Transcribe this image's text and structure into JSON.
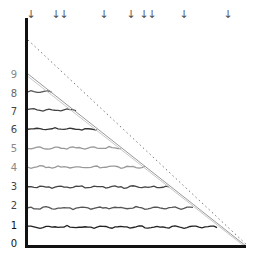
{
  "diagram": {
    "type": "staircase-levels",
    "y_labels": [
      {
        "text": "0",
        "y": 244,
        "color": "#111111"
      },
      {
        "text": "1",
        "y": 226,
        "color": "#111111"
      },
      {
        "text": "2",
        "y": 206,
        "color": "#444444"
      },
      {
        "text": "3",
        "y": 187,
        "color": "#444444"
      },
      {
        "text": "4",
        "y": 168,
        "color": "#888888"
      },
      {
        "text": "5",
        "y": 149,
        "color": "#888888"
      },
      {
        "text": "6",
        "y": 130,
        "color": "#444444"
      },
      {
        "text": "7",
        "y": 112,
        "color": "#444444"
      },
      {
        "text": "8",
        "y": 94,
        "color": "#666666"
      },
      {
        "text": "9",
        "y": 75,
        "color": "#888888"
      }
    ],
    "arrows": [
      {
        "glyph": "↓",
        "x": 31
      },
      {
        "glyph": "↓",
        "x": 56
      },
      {
        "glyph": "↓",
        "x": 64
      },
      {
        "glyph": "↓",
        "x": 104
      },
      {
        "glyph": "↓",
        "x": 131
      },
      {
        "glyph": "↓",
        "x": 144
      },
      {
        "glyph": "↓",
        "x": 152
      },
      {
        "glyph": "↓",
        "x": 184
      },
      {
        "glyph": "↓",
        "x": 228
      }
    ],
    "levels": [
      {
        "level": 1,
        "y": 227,
        "end_x": 219,
        "color": "#222222"
      },
      {
        "level": 2,
        "y": 208,
        "end_x": 195,
        "color": "#555555"
      },
      {
        "level": 3,
        "y": 187,
        "end_x": 170,
        "color": "#444444"
      },
      {
        "level": 4,
        "y": 167,
        "end_x": 146,
        "color": "#999999"
      },
      {
        "level": 5,
        "y": 148,
        "end_x": 122,
        "color": "#999999"
      },
      {
        "level": 6,
        "y": 129,
        "end_x": 99,
        "color": "#333333"
      },
      {
        "level": 7,
        "y": 110,
        "end_x": 76,
        "color": "#444444"
      },
      {
        "level": 8,
        "y": 92,
        "end_x": 52,
        "color": "#555555"
      }
    ],
    "colors": {
      "axis": "#111111",
      "diagonal": "#aaaaaa",
      "dotted": "#777777"
    }
  }
}
